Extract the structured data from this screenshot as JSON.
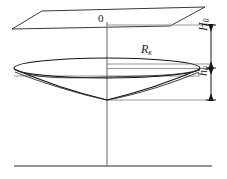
{
  "figure": {
    "name": "cone-of-depression-diagram",
    "type": "technical-line-drawing",
    "width": 227,
    "height": 179,
    "background": "#ffffff",
    "line_color": "#1a1a1a",
    "thin_line_color": "#7d7d7d"
  },
  "labels": {
    "origin": "0",
    "radius_symbol": "R",
    "radius_subscript": "к",
    "head_symbol": "H",
    "head_subscript": "0",
    "depth_symbol": "h",
    "depth_subscript": "0"
  },
  "geometry": {
    "plane": {
      "name": "horizontal-reference-plane",
      "points": "42,11 205,7 170,26 12,29"
    },
    "axis": {
      "name": "vertical-well-axis",
      "x": 107,
      "y_top": 22,
      "y_bottom": 166
    },
    "ground_line": {
      "name": "ground-line",
      "x1": 14,
      "x2": 212,
      "y": 166
    },
    "ellipse": {
      "name": "radius-of-influence-ellipse",
      "cx": 107,
      "cy": 68,
      "rx": 93,
      "ry": 10
    },
    "cone_apex": {
      "x": 107,
      "y": 100
    },
    "dimension_line_x": 211,
    "dimension_ticks": [
      25,
      68,
      100
    ],
    "extension_lines": [
      {
        "name": "ext-top",
        "x1": 107,
        "x2": 212,
        "y": 25
      },
      {
        "name": "ext-mid-upper",
        "x1": 107,
        "x2": 212,
        "y": 64
      },
      {
        "name": "ext-mid",
        "x1": 107,
        "x2": 212,
        "y": 68
      },
      {
        "name": "ext-mid-lower",
        "x1": 14,
        "x2": 200,
        "y": 76
      },
      {
        "name": "ext-bottom",
        "x1": 107,
        "x2": 212,
        "y": 100
      }
    ]
  }
}
